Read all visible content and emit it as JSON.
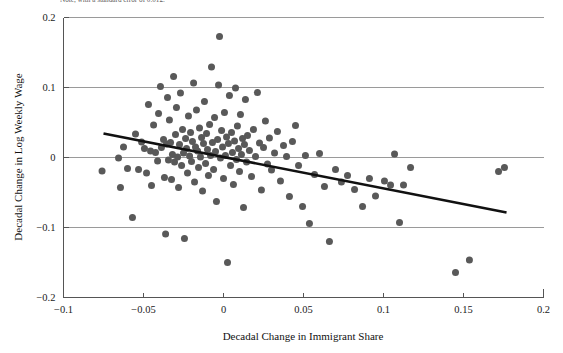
{
  "caption_fragment": "Note, with a standard error of 0.012.",
  "chart_data": {
    "type": "scatter",
    "title": "",
    "xlabel": "Decadal Change in Immigrant Share",
    "ylabel": "Decadal Change in Log Weekly Wage",
    "xlim": [
      -0.1,
      0.2
    ],
    "ylim": [
      -0.2,
      0.2
    ],
    "xticks": [
      -0.1,
      -0.05,
      0,
      0.05,
      0.1,
      0.15,
      0.2
    ],
    "xticklabels": [
      "−0.1",
      "−0.05",
      "0",
      "0.05",
      "0.1",
      "0.15",
      "0.2"
    ],
    "yticks": [
      0.2,
      0.1,
      0,
      -0.1,
      -0.2
    ],
    "yticklabels": [
      "0.2",
      "0.1",
      "0",
      "−0.1",
      "−0.2"
    ],
    "grid": "horizontal",
    "legend": "none",
    "marker_color": "#595959",
    "marker_size": 4.6,
    "fit_line": {
      "color": "#111111",
      "x_start": -0.075,
      "y_start": 0.0343,
      "x_end": 0.1769,
      "y_end": -0.0786
    },
    "points": [
      [
        -0.0759,
        -0.0193
      ],
      [
        -0.0656,
        -0.0007
      ],
      [
        -0.0644,
        -0.0429
      ],
      [
        -0.0625,
        0.015
      ],
      [
        -0.06,
        -0.0157
      ],
      [
        -0.0569,
        -0.0857
      ],
      [
        -0.055,
        0.0336
      ],
      [
        -0.0531,
        -0.0171
      ],
      [
        -0.0512,
        0.0221
      ],
      [
        -0.0494,
        0.0129
      ],
      [
        -0.0481,
        -0.0221
      ],
      [
        -0.0469,
        0.0757
      ],
      [
        -0.0456,
        0.0093
      ],
      [
        -0.045,
        -0.04
      ],
      [
        -0.0437,
        0.0464
      ],
      [
        -0.0425,
        0.0071
      ],
      [
        -0.0412,
        -0.005
      ],
      [
        -0.0406,
        0.0629
      ],
      [
        -0.0394,
        0.1014
      ],
      [
        -0.0388,
        0.0143
      ],
      [
        -0.0375,
        0.0257
      ],
      [
        -0.0369,
        -0.0286
      ],
      [
        -0.0362,
        -0.1093
      ],
      [
        -0.0356,
        0.0193
      ],
      [
        -0.035,
        0.0857
      ],
      [
        -0.0344,
        -0.0036
      ],
      [
        -0.0338,
        0.0536
      ],
      [
        -0.0331,
        0.0214
      ],
      [
        -0.0325,
        -0.0314
      ],
      [
        -0.0319,
        0.0043
      ],
      [
        -0.0312,
        0.1157
      ],
      [
        -0.0306,
        -0.0064
      ],
      [
        -0.03,
        0.0329
      ],
      [
        -0.0294,
        0.0714
      ],
      [
        -0.0287,
        0.0007
      ],
      [
        -0.0281,
        -0.0429
      ],
      [
        -0.0275,
        0.0186
      ],
      [
        -0.0269,
        0.0921
      ],
      [
        -0.0262,
        -0.0114
      ],
      [
        -0.0256,
        0.04
      ],
      [
        -0.025,
        0.0064
      ],
      [
        -0.0244,
        -0.1157
      ],
      [
        -0.0237,
        0.0271
      ],
      [
        -0.0231,
        0.0129
      ],
      [
        -0.0225,
        -0.0221
      ],
      [
        -0.0219,
        0.0593
      ],
      [
        -0.0212,
        0.0021
      ],
      [
        -0.0206,
        0.0357
      ],
      [
        -0.02,
        -0.0057
      ],
      [
        -0.0194,
        0.0229
      ],
      [
        -0.0187,
        0.1064
      ],
      [
        -0.0181,
        -0.035
      ],
      [
        -0.0175,
        0.015
      ],
      [
        -0.0169,
        0.0679
      ],
      [
        -0.0162,
        0.0093
      ],
      [
        -0.0156,
        -0.0143
      ],
      [
        -0.015,
        0.0421
      ],
      [
        -0.0144,
        0.0007
      ],
      [
        -0.0137,
        0.0286
      ],
      [
        -0.0131,
        -0.0479
      ],
      [
        -0.0125,
        0.02
      ],
      [
        -0.0119,
        0.08
      ],
      [
        -0.0112,
        -0.0086
      ],
      [
        -0.0106,
        0.0343
      ],
      [
        -0.01,
        0.0114
      ],
      [
        -0.0094,
        -0.0257
      ],
      [
        -0.0087,
        0.0471
      ],
      [
        -0.0081,
        0.0029
      ],
      [
        -0.0075,
        0.1293
      ],
      [
        -0.0069,
        0.0214
      ],
      [
        -0.0062,
        -0.0171
      ],
      [
        -0.0056,
        0.0571
      ],
      [
        -0.005,
        0.0086
      ],
      [
        -0.0044,
        -0.0629
      ],
      [
        -0.0037,
        0.0257
      ],
      [
        -0.0031,
        0.1036
      ],
      [
        -0.0025,
        0.1729
      ],
      [
        -0.0019,
        -0.0007
      ],
      [
        -0.0012,
        0.0386
      ],
      [
        -0.0006,
        0.015
      ],
      [
        0.0,
        -0.03
      ],
      [
        0.0006,
        0.0643
      ],
      [
        0.0012,
        0.0029
      ],
      [
        0.0019,
        0.0293
      ],
      [
        0.0025,
        -0.15
      ],
      [
        0.0031,
        0.02
      ],
      [
        0.0037,
        0.0886
      ],
      [
        0.0044,
        -0.0114
      ],
      [
        0.005,
        0.0357
      ],
      [
        0.0056,
        0.0071
      ],
      [
        0.0062,
        -0.0386
      ],
      [
        0.0069,
        0.0236
      ],
      [
        0.0075,
        0.0993
      ],
      [
        0.0081,
        -0.0029
      ],
      [
        0.0087,
        0.045
      ],
      [
        0.0094,
        0.0129
      ],
      [
        0.01,
        -0.02
      ],
      [
        0.0106,
        0.0614
      ],
      [
        0.0112,
        0.0043
      ],
      [
        0.0119,
        0.0271
      ],
      [
        0.0125,
        -0.0714
      ],
      [
        0.0131,
        0.0186
      ],
      [
        0.0137,
        0.0829
      ],
      [
        0.0144,
        -0.0064
      ],
      [
        0.015,
        0.0314
      ],
      [
        0.0162,
        0.01
      ],
      [
        0.0175,
        -0.0271
      ],
      [
        0.0187,
        0.04
      ],
      [
        0.02,
        0.0014
      ],
      [
        0.0212,
        0.0929
      ],
      [
        0.0225,
        0.0207
      ],
      [
        0.0237,
        -0.0464
      ],
      [
        0.025,
        0.0143
      ],
      [
        0.0262,
        0.0521
      ],
      [
        0.0275,
        -0.0093
      ],
      [
        0.0287,
        0.0279
      ],
      [
        0.03,
        -0.0179
      ],
      [
        0.0319,
        0.0064
      ],
      [
        0.0337,
        0.0371
      ],
      [
        0.0356,
        -0.0336
      ],
      [
        0.0375,
        0.0171
      ],
      [
        0.0394,
        0.0014
      ],
      [
        0.0412,
        -0.0557
      ],
      [
        0.0431,
        0.0229
      ],
      [
        0.045,
        0.0457
      ],
      [
        0.0469,
        -0.0114
      ],
      [
        0.0494,
        -0.07
      ],
      [
        0.0512,
        0.0029
      ],
      [
        0.0537,
        -0.0943
      ],
      [
        0.0569,
        -0.0243
      ],
      [
        0.06,
        0.0057
      ],
      [
        0.0631,
        -0.0414
      ],
      [
        0.0662,
        -0.12
      ],
      [
        0.07,
        -0.0171
      ],
      [
        0.0737,
        -0.035
      ],
      [
        0.0775,
        -0.0257
      ],
      [
        0.0819,
        -0.0457
      ],
      [
        0.0869,
        -0.07
      ],
      [
        0.0912,
        -0.03
      ],
      [
        0.095,
        -0.055
      ],
      [
        0.1006,
        -0.0336
      ],
      [
        0.1044,
        -0.0393
      ],
      [
        0.1069,
        0.005
      ],
      [
        0.11,
        -0.0929
      ],
      [
        0.1125,
        -0.0393
      ],
      [
        0.1169,
        -0.0143
      ],
      [
        0.145,
        -0.1643
      ],
      [
        0.1537,
        -0.1464
      ],
      [
        0.1719,
        -0.02
      ],
      [
        0.1756,
        -0.0143
      ]
    ]
  }
}
